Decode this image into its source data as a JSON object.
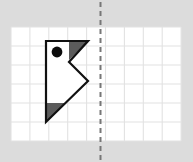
{
  "figure": {
    "canvas": {
      "width": 193,
      "height": 162
    },
    "background_color": "#dcdcdc",
    "grid": {
      "label": "graph-paper-grid",
      "x": 11,
      "y": 27,
      "cols": 9,
      "rows": 6,
      "cell_width": 18.9,
      "cell_height": 19,
      "line_color": "#e2e2e2",
      "fill_color": "#ffffff",
      "line_width": 1.1
    },
    "mirror_line": {
      "label": "axis-of-symmetry",
      "orientation": "vertical",
      "x": 100.5,
      "y_start": 2,
      "y_end": 160,
      "color": "#777777",
      "width": 2,
      "dash": "5 4"
    },
    "shape": {
      "label": "flag-polygon",
      "outline_color": "#111111",
      "outline_width": 2.2,
      "fill_color": "#ffffff",
      "points": "46,41 88,41 69,62 88,81 46,122",
      "vertices": [
        {
          "name": "top-left",
          "x": 46,
          "y": 41
        },
        {
          "name": "top-right",
          "x": 88,
          "y": 41
        },
        {
          "name": "notch-inner",
          "x": 69,
          "y": 62
        },
        {
          "name": "notch-point",
          "x": 88,
          "y": 81
        },
        {
          "name": "bottom-tip",
          "x": 46,
          "y": 122
        }
      ]
    },
    "shaded_regions": [
      {
        "label": "top-right-shaded-triangle",
        "points": "69,41 88,41 69,60",
        "fill_color": "#5b5b5b"
      },
      {
        "label": "bottom-left-shaded-triangle",
        "points": "46,103 65,103 46,122",
        "fill_color": "#5b5b5b"
      }
    ],
    "marker_dot": {
      "label": "reference-dot",
      "cx": 57,
      "cy": 52,
      "r": 5.4,
      "fill_color": "#0c0c0c"
    }
  }
}
